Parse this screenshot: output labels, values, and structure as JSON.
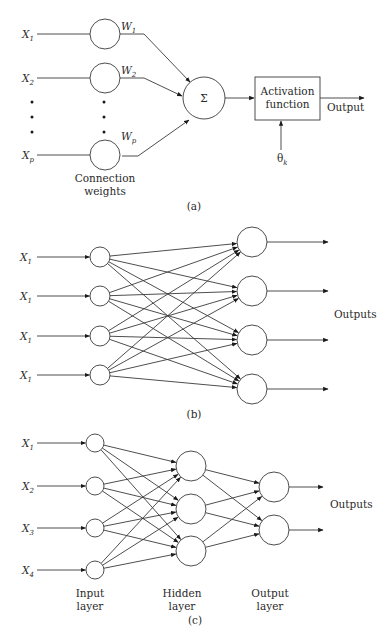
{
  "panel_a": {
    "caption": "(a)",
    "inputs": [
      {
        "label": "X",
        "sub": "1",
        "y": 34
      },
      {
        "label": "X",
        "sub": "2",
        "y": 78
      },
      {
        "label": "X",
        "sub": "p",
        "y": 155
      }
    ],
    "weights": [
      {
        "label": "W",
        "sub": "1"
      },
      {
        "label": "W",
        "sub": "2"
      },
      {
        "label": "W",
        "sub": "p"
      }
    ],
    "weights_caption_line1": "Connection",
    "weights_caption_line2": "weights",
    "summation_symbol": "Σ",
    "activation_line1": "Activation",
    "activation_line2": "function",
    "output_label": "Output",
    "threshold_label": "θ",
    "threshold_sub": "k"
  },
  "panel_b": {
    "caption": "(b)",
    "input_labels": [
      {
        "label": "X",
        "sub": "1"
      },
      {
        "label": "X",
        "sub": "1"
      },
      {
        "label": "X",
        "sub": "1"
      },
      {
        "label": "X",
        "sub": "1"
      }
    ],
    "input_node_ys": [
      257,
      296,
      336,
      375
    ],
    "output_node_ys": [
      242,
      291,
      340,
      389
    ],
    "outputs_label": "Outputs"
  },
  "panel_c": {
    "caption": "(c)",
    "input_labels": [
      {
        "label": "X",
        "sub": "1"
      },
      {
        "label": "X",
        "sub": "2"
      },
      {
        "label": "X",
        "sub": "3"
      },
      {
        "label": "X",
        "sub": "4"
      }
    ],
    "input_node_ys": [
      443,
      486,
      528,
      570
    ],
    "hidden_node_ys": [
      466,
      509,
      551
    ],
    "output_node_ys": [
      487,
      530
    ],
    "outputs_label": "Outputs",
    "layer_labels": [
      {
        "line1": "Input",
        "line2": "layer"
      },
      {
        "line1": "Hidden",
        "line2": "layer"
      },
      {
        "line1": "Output",
        "line2": "layer"
      }
    ]
  }
}
